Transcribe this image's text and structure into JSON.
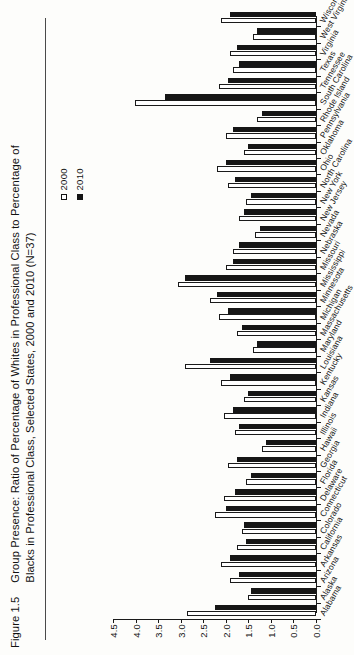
{
  "figure": {
    "number": "Figure 1.5",
    "caption": "Group Presence: Ratio of Percentage of Whites in Professional Class to Percentage of Blacks in Professional Class, Selected States, 2000 and 2010 (N=37)"
  },
  "legend": {
    "position": "left-middle",
    "entries": [
      {
        "label": "2000",
        "swatch": "hollow-square",
        "color": "#ffffff"
      },
      {
        "label": "2010",
        "swatch": "filled-square",
        "color": "#161616"
      }
    ]
  },
  "chart_data": {
    "type": "bar",
    "orientation": "horizontal",
    "title": "Group Presence: Ratio of Percentage of Whites in Professional Class to Percentage of Blacks in Professional Class, Selected States, 2000 and 2010 (N=37)",
    "xlabel": "",
    "ylabel": "",
    "xlim": [
      0.0,
      4.5
    ],
    "grid": false,
    "ticks": [
      "0.0",
      "0.5",
      "1.0",
      "1.5",
      "2.0",
      "2.5",
      "3.0",
      "3.5",
      "4.0",
      "4.5"
    ],
    "tick_values": [
      0.0,
      0.5,
      1.0,
      1.5,
      2.0,
      2.5,
      3.0,
      3.5,
      4.0,
      4.5
    ],
    "categories": [
      "Alabama",
      "Alaska",
      "Arizona",
      "Arkansas",
      "California",
      "Colorado",
      "Connecticut",
      "Delaware",
      "Florida",
      "Georgia",
      "Hawaii",
      "Illinois",
      "Indiana",
      "Kansas",
      "Kentucky",
      "Louisiana",
      "Maryland",
      "Massachusetts",
      "Michigan",
      "Minnesota",
      "Mississippi",
      "Missouri",
      "Nebraska",
      "Nevada",
      "New Jersey",
      "New York",
      "North Carolina",
      "Ohio",
      "Oklahoma",
      "Pennsylvania",
      "Rhode Island",
      "South Carolina",
      "Tennessee",
      "Texas",
      "Virginia",
      "West Virginia",
      "Wisconsin"
    ],
    "series": [
      {
        "name": "2000",
        "color": "#ffffff",
        "values": [
          2.85,
          1.5,
          1.9,
          2.1,
          1.75,
          1.65,
          2.25,
          2.05,
          1.55,
          1.95,
          1.2,
          1.8,
          2.05,
          1.6,
          2.1,
          2.9,
          1.4,
          1.75,
          2.15,
          2.35,
          3.05,
          2.0,
          1.85,
          1.35,
          1.7,
          1.55,
          1.95,
          2.2,
          1.6,
          2.0,
          1.3,
          4.02,
          2.15,
          1.85,
          1.9,
          1.4,
          2.1
        ]
      },
      {
        "name": "2010",
        "color": "#161616",
        "values": [
          2.25,
          1.45,
          1.7,
          1.9,
          1.55,
          1.6,
          2.0,
          1.8,
          1.45,
          1.75,
          1.1,
          1.7,
          1.85,
          1.5,
          1.9,
          2.35,
          1.3,
          1.65,
          1.95,
          2.2,
          2.9,
          1.85,
          1.7,
          1.25,
          1.6,
          1.45,
          1.8,
          2.0,
          1.5,
          1.85,
          1.2,
          3.35,
          1.95,
          1.7,
          1.75,
          1.3,
          1.9
        ]
      }
    ]
  }
}
